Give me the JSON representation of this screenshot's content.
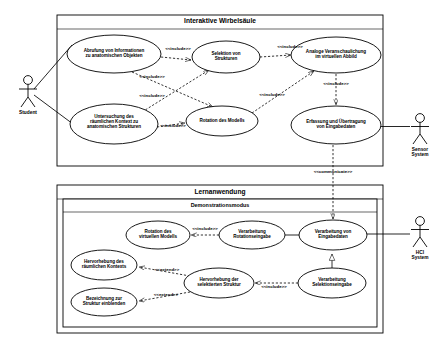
{
  "diagram": {
    "kind": "uml-use-case-diagram",
    "language": "de",
    "stroke_color": "#000000",
    "fill_color": "#ffffff",
    "background": "#ffffff"
  },
  "systems": [
    {
      "id": "interaktive-wirbelsaeule",
      "title": "Interaktive Wirbelsäule",
      "box": {
        "x": 57,
        "y": 15,
        "w": 326,
        "h": 151
      }
    },
    {
      "id": "lernanwendung",
      "title": "Lernanwendung",
      "box": {
        "x": 57,
        "y": 185,
        "w": 326,
        "h": 148
      },
      "subsystem": {
        "id": "demonstrationsmodus",
        "title": "Demonstrationsmodus",
        "box": {
          "x": 63,
          "y": 197,
          "w": 314,
          "h": 130
        }
      }
    }
  ],
  "actors": [
    {
      "id": "student",
      "label": "Student",
      "x": 28,
      "y": 88
    },
    {
      "id": "sensor-system",
      "label": "Sensor\nSystem",
      "x": 420,
      "y": 126
    },
    {
      "id": "hci-system",
      "label": "HCI\nSystem",
      "x": 420,
      "y": 229
    }
  ],
  "use_cases": [
    {
      "id": "uc-abrufung-informationen",
      "label": "Abrufung von Informationen\nzu anatomischen Objekten",
      "cx": 114,
      "cy": 54,
      "rx": 47,
      "ry": 19,
      "system": "interaktive-wirbelsaeule"
    },
    {
      "id": "uc-selektion-strukturen",
      "label": "Selektion von\nStrukturen",
      "cx": 226,
      "cy": 57,
      "rx": 34,
      "ry": 16,
      "system": "interaktive-wirbelsaeule"
    },
    {
      "id": "uc-analoge-veranschaulichung",
      "label": "Analoge Veranschaulichung\nim virtuellen Abbild",
      "cx": 336,
      "cy": 55,
      "rx": 45,
      "ry": 18,
      "system": "interaktive-wirbelsaeule"
    },
    {
      "id": "uc-untersuchung-kontext",
      "label": "Untersuchung des\nräumlichen Kontext zu\nanatomischen Strukturen",
      "cx": 114,
      "cy": 124,
      "rx": 44,
      "ry": 20,
      "system": "interaktive-wirbelsaeule"
    },
    {
      "id": "uc-rotation-modells",
      "label": "Rotation des Modells",
      "cx": 222,
      "cy": 121,
      "rx": 36,
      "ry": 15,
      "system": "interaktive-wirbelsaeule"
    },
    {
      "id": "uc-erfassung-uebertragung",
      "label": "Erfassung und Übertragung\nvon Eingabedaten",
      "cx": 336,
      "cy": 125,
      "rx": 45,
      "ry": 19,
      "system": "interaktive-wirbelsaeule"
    },
    {
      "id": "uc-rotation-virtuelles-modell",
      "label": "Rotation des\nvirtuellen Modells",
      "cx": 158,
      "cy": 235,
      "rx": 32,
      "ry": 14,
      "system": "demonstrationsmodus"
    },
    {
      "id": "uc-verarbeitung-rotationseingabe",
      "label": "Verarbeitung\nRotationseingabe",
      "cx": 252,
      "cy": 235,
      "rx": 33,
      "ry": 14,
      "system": "demonstrationsmodus"
    },
    {
      "id": "uc-verarbeitung-eingabedaten",
      "label": "Verarbeitung von\nEingabedaten",
      "cx": 333,
      "cy": 235,
      "rx": 34,
      "ry": 15,
      "system": "demonstrationsmodus"
    },
    {
      "id": "uc-hervorhebung-kontext",
      "label": "Hervorhebung des\nräumlichen Kontexts",
      "cx": 104,
      "cy": 265,
      "rx": 33,
      "ry": 15,
      "system": "demonstrationsmodus"
    },
    {
      "id": "uc-hervorhebung-selektierte",
      "label": "Hervorhebung der\nselektierten Struktur",
      "cx": 219,
      "cy": 283,
      "rx": 35,
      "ry": 15,
      "system": "demonstrationsmodus"
    },
    {
      "id": "uc-verarbeitung-selektionseingabe",
      "label": "Verarbeitung\nSelektionseingabe",
      "cx": 332,
      "cy": 283,
      "rx": 34,
      "ry": 15,
      "system": "demonstrationsmodus"
    },
    {
      "id": "uc-bezeichnung-einblenden",
      "label": "Bezeichnung zur\nStruktur einblenden",
      "cx": 104,
      "cy": 302,
      "rx": 33,
      "ry": 14,
      "system": "demonstrationsmodus"
    }
  ],
  "relationship_labels": [
    {
      "id": "rel-include-1",
      "text": "<<include>>",
      "x": 178,
      "y": 51,
      "rotate": 0
    },
    {
      "id": "rel-include-2",
      "text": "<<include>>",
      "x": 290,
      "y": 49,
      "rotate": 0
    },
    {
      "id": "rel-include-3",
      "text": "<<include>>",
      "x": 152,
      "y": 79,
      "rotate": 0
    },
    {
      "id": "rel-include-4",
      "text": "<<include>>",
      "x": 152,
      "y": 98,
      "rotate": 0
    },
    {
      "id": "rel-include-5",
      "text": "<<include>>",
      "x": 272,
      "y": 97,
      "rotate": 0
    },
    {
      "id": "rel-include-6",
      "text": "<<include>>",
      "x": 336,
      "y": 86,
      "rotate": 0
    },
    {
      "id": "rel-include-7",
      "text": "<<include>>",
      "x": 173,
      "y": 128,
      "rotate": 0
    },
    {
      "id": "rel-communicate",
      "text": "<<communicate>>",
      "x": 333,
      "y": 174,
      "rotate": 0
    },
    {
      "id": "rel-include-8",
      "text": "<<include>>",
      "x": 205,
      "y": 231,
      "rotate": 0
    },
    {
      "id": "rel-extend-1",
      "text": "<<extend>>",
      "x": 167,
      "y": 272,
      "rotate": 0
    },
    {
      "id": "rel-include-9",
      "text": "<<include>>",
      "x": 274,
      "y": 289,
      "rotate": 0
    },
    {
      "id": "rel-extend-2",
      "text": "<<extend>>",
      "x": 166,
      "y": 297,
      "rotate": 0
    }
  ],
  "connections": [
    {
      "id": "conn-student-abrufung",
      "from": "student",
      "to": "uc-abrufung-informationen",
      "type": "association"
    },
    {
      "id": "conn-student-untersuchung",
      "from": "student",
      "to": "uc-untersuchung-kontext",
      "type": "association"
    },
    {
      "id": "conn-sensor-erfassung",
      "from": "sensor-system",
      "to": "uc-erfassung-uebertragung",
      "type": "association"
    },
    {
      "id": "conn-hci-verarbeitung",
      "from": "hci-system",
      "to": "uc-verarbeitung-eingabedaten",
      "type": "association"
    },
    {
      "id": "conn-abrufung-selektion",
      "from": "uc-abrufung-informationen",
      "to": "uc-selektion-strukturen",
      "type": "include"
    },
    {
      "id": "conn-selektion-analoge",
      "from": "uc-selektion-strukturen",
      "to": "uc-analoge-veranschaulichung",
      "type": "include"
    },
    {
      "id": "conn-abrufung-rotation",
      "from": "uc-abrufung-informationen",
      "to": "uc-rotation-modells",
      "type": "include"
    },
    {
      "id": "conn-untersuchung-selektion",
      "from": "uc-untersuchung-kontext",
      "to": "uc-selektion-strukturen",
      "type": "include"
    },
    {
      "id": "conn-untersuchung-rotation",
      "from": "uc-untersuchung-kontext",
      "to": "uc-rotation-modells",
      "type": "include"
    },
    {
      "id": "conn-rotation-analoge",
      "from": "uc-rotation-modells",
      "to": "uc-analoge-veranschaulichung",
      "type": "include"
    },
    {
      "id": "conn-analoge-erfassung",
      "from": "uc-analoge-veranschaulichung",
      "to": "uc-erfassung-uebertragung",
      "type": "include"
    },
    {
      "id": "conn-erfassung-verarbeitung",
      "from": "uc-erfassung-uebertragung",
      "to": "uc-verarbeitung-eingabedaten",
      "type": "communicate"
    },
    {
      "id": "conn-rotationseingabe-rotation",
      "from": "uc-verarbeitung-rotationseingabe",
      "to": "uc-rotation-virtuelles-modell",
      "type": "include"
    },
    {
      "id": "conn-eingabedaten-rotationseingabe",
      "from": "uc-verarbeitung-eingabedaten",
      "to": "uc-verarbeitung-rotationseingabe",
      "type": "association"
    },
    {
      "id": "conn-eingabedaten-selektionseingabe",
      "from": "uc-verarbeitung-eingabedaten",
      "to": "uc-verarbeitung-selektionseingabe",
      "type": "generalization"
    },
    {
      "id": "conn-selektionseingabe-hervorhebung",
      "from": "uc-verarbeitung-selektionseingabe",
      "to": "uc-hervorhebung-selektierte",
      "type": "include"
    },
    {
      "id": "conn-hervorhebung-kontext-extend",
      "from": "uc-hervorhebung-selektierte",
      "to": "uc-hervorhebung-kontext",
      "type": "extend"
    },
    {
      "id": "conn-hervorhebung-bezeichnung-extend",
      "from": "uc-hervorhebung-selektierte",
      "to": "uc-bezeichnung-einblenden",
      "type": "extend"
    }
  ]
}
